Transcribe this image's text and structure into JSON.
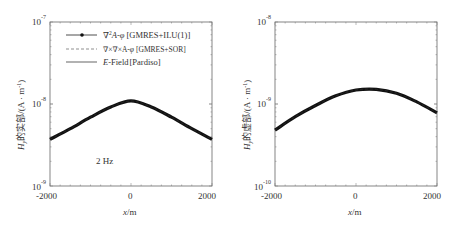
{
  "chart_data": [
    {
      "type": "line",
      "panel": "left",
      "title": "",
      "xlabel": "x/m",
      "ylabel": "H_y的实部/(A·m⁻¹)",
      "yscale": "log",
      "xlim": [
        -2000,
        2000
      ],
      "ylim": [
        1e-09,
        1e-07
      ],
      "xticks": [
        "-2000",
        "0",
        "2000"
      ],
      "yticks": [
        {
          "base": "10",
          "exp": "-9"
        },
        {
          "base": "10",
          "exp": "-8"
        },
        {
          "base": "10",
          "exp": "-7"
        }
      ],
      "annotation": "2 Hz",
      "legend": [
        {
          "label_prefix": "∇²A-φ",
          "label_bracket": "[GMRES+ILU(1)]",
          "style": "solid-marker"
        },
        {
          "label_prefix": "∇×∇×A-φ",
          "label_bracket": "[GMRES+SOR]",
          "style": "dashed"
        },
        {
          "label_prefix": "E",
          "label_mid": "-Field",
          "label_bracket": "[Pardiso]",
          "style": "solid"
        }
      ],
      "x": [
        -2000,
        -1500,
        -1000,
        -500,
        0,
        500,
        1000,
        1500,
        2000
      ],
      "series": [
        {
          "name": "∇²A-φ [GMRES+ILU(1)]",
          "values": [
            3.7e-09,
            5e-09,
            6.9e-09,
            9.2e-09,
            1.09e-08,
            9.2e-09,
            6.9e-09,
            5e-09,
            3.7e-09
          ]
        },
        {
          "name": "∇×∇×A-φ [GMRES+SOR]",
          "values": [
            3.7e-09,
            5e-09,
            6.9e-09,
            9.2e-09,
            1.09e-08,
            9.2e-09,
            6.9e-09,
            5e-09,
            3.7e-09
          ]
        },
        {
          "name": "E-Field [Pardiso]",
          "values": [
            3.7e-09,
            5e-09,
            6.9e-09,
            9.2e-09,
            1.09e-08,
            9.2e-09,
            6.9e-09,
            5e-09,
            3.7e-09
          ]
        }
      ],
      "grid": false
    },
    {
      "type": "line",
      "panel": "right",
      "title": "",
      "xlabel": "x/m",
      "ylabel": "H_y的虚部/(A·m⁻¹)",
      "yscale": "log",
      "xlim": [
        -2000,
        2000
      ],
      "ylim": [
        1e-10,
        1e-08
      ],
      "xticks": [
        "-2000",
        "0",
        "2000"
      ],
      "yticks": [
        {
          "base": "10",
          "exp": "-10"
        },
        {
          "base": "10",
          "exp": "-9"
        },
        {
          "base": "10",
          "exp": "-8"
        }
      ],
      "x": [
        -2000,
        -1500,
        -1000,
        -500,
        0,
        500,
        1000,
        1500,
        2000
      ],
      "series": [
        {
          "name": "∇²A-φ [GMRES+ILU(1)]",
          "values": [
            4.8e-10,
            7e-10,
            9.6e-10,
            1.26e-09,
            1.48e-09,
            1.51e-09,
            1.35e-09,
            1.06e-09,
            7.8e-10
          ]
        },
        {
          "name": "∇×∇×A-φ [GMRES+SOR]",
          "values": [
            4.8e-10,
            7e-10,
            9.6e-10,
            1.26e-09,
            1.48e-09,
            1.51e-09,
            1.35e-09,
            1.06e-09,
            7.8e-10
          ]
        },
        {
          "name": "E-Field [Pardiso]",
          "values": [
            4.8e-10,
            7e-10,
            9.6e-10,
            1.26e-09,
            1.48e-09,
            1.51e-09,
            1.35e-09,
            1.06e-09,
            7.8e-10
          ]
        }
      ],
      "grid": false
    }
  ],
  "labels": {
    "left_ylabel_main": "H",
    "left_ylabel_sub": "y",
    "left_ylabel_rest": "的实部/(A · m",
    "right_ylabel_main": "H",
    "right_ylabel_sub": "y",
    "right_ylabel_rest": "的虚部/(A · m",
    "ylabel_exp": "-1",
    "ylabel_close": ")",
    "xlabel_x": "x",
    "xlabel_unit": "/m",
    "freq": "2 Hz",
    "xt_neg": "-2000",
    "xt_zero": "0",
    "xt_pos": "2000",
    "ten": "10",
    "left_exp_top": "-7",
    "left_exp_mid": "-8",
    "left_exp_bot": "-9",
    "right_exp_top": "-8",
    "right_exp_mid": "-9",
    "right_exp_bot": "-10",
    "leg1_a": "∇",
    "leg1_sup": "2",
    "leg1_b": "A-",
    "leg1_phi": "φ",
    "leg1_br": "[GMRES+ILU(1)]",
    "leg2_a": "∇×∇×A-",
    "leg2_phi": "φ",
    "leg2_br": "[GMRES+SOR]",
    "leg3_e": "E",
    "leg3_a": "-Field",
    "leg3_br": "[Pardiso]"
  },
  "colors": {
    "frame": "#555555",
    "curve": "#111111",
    "text": "#333333"
  }
}
